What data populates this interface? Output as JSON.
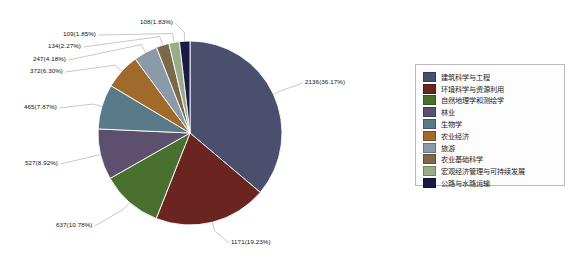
{
  "chart_data": {
    "type": "pie",
    "title": "",
    "total": 5906,
    "legend_position": "right",
    "categories": [
      "建筑科学与工程",
      "环境科学与资源利用",
      "自然地理学和测绘学",
      "林业",
      "生物学",
      "农业经济",
      "旅游",
      "农业基础科学",
      "宏观经济管理与可持续发展",
      "公路与水路运输"
    ],
    "values": [
      2136,
      1171,
      637,
      527,
      465,
      372,
      247,
      134,
      109,
      108
    ],
    "percents": [
      "36.17%",
      "19.23%",
      "10.78%",
      "8.92%",
      "7.87%",
      "6.30%",
      "4.18%",
      "2.27%",
      "1.85%",
      "1.83%"
    ],
    "labels": [
      "2136(36.17%)",
      "1171(19.23%)",
      "637(10.78%)",
      "527(8.92%)",
      "465(7.87%)",
      "372(6.30%)",
      "247(4.18%)",
      "134(2.27%)",
      "109(1.85%)",
      "108(1.83%)"
    ],
    "colors": [
      "#4a4f6e",
      "#6b2520",
      "#4a7030",
      "#5d4f6e",
      "#5a7a8a",
      "#a06a2a",
      "#8a9aa8",
      "#7a6a4a",
      "#9aab8a",
      "#1a1a44"
    ]
  },
  "legend": {
    "items": [
      {
        "label": "建筑科学与工程",
        "color": "#4a4f6e"
      },
      {
        "label": "环境科学与资源利用",
        "color": "#6b2520"
      },
      {
        "label": "自然地理学和测绘学",
        "color": "#4a7030"
      },
      {
        "label": "林业",
        "color": "#5d4f6e"
      },
      {
        "label": "生物学",
        "color": "#5a7a8a"
      },
      {
        "label": "农业经济",
        "color": "#a06a2a"
      },
      {
        "label": "旅游",
        "color": "#8a9aa8"
      },
      {
        "label": "农业基础科学",
        "color": "#7a6a4a"
      },
      {
        "label": "宏观经济管理与可持续发展",
        "color": "#9aab8a"
      },
      {
        "label": "公路与水路运输",
        "color": "#1a1a44"
      }
    ]
  }
}
